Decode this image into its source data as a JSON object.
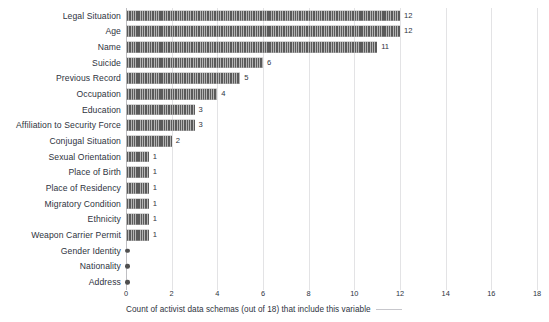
{
  "chart_data": {
    "type": "bar",
    "orientation": "horizontal",
    "title": "",
    "subtitle": "",
    "xlabel": "Count of activist data schemas (out of 18) that include this variable",
    "ylabel": "",
    "xlim": [
      0,
      18
    ],
    "xticks": [
      "0",
      "2",
      "4",
      "6",
      "8",
      "10",
      "12",
      "14",
      "16",
      "18"
    ],
    "xtick_values": [
      0,
      2,
      4,
      6,
      8,
      10,
      12,
      14,
      16,
      18
    ],
    "grid": "vertical",
    "legend": "none",
    "categories": [
      "Legal Situation",
      "Age",
      "Name",
      "Suicide",
      "Previous Record",
      "Occupation",
      "Education",
      "Affiliation to Security Force",
      "Conjugal Situation",
      "Sexual Orientation",
      "Place of Birth",
      "Place of Residency",
      "Migratory Condition",
      "Ethnicity",
      "Weapon Carrier Permit",
      "Gender Identity",
      "Nationality",
      "Address"
    ],
    "values": [
      12,
      12,
      11,
      6,
      5,
      4,
      3,
      3,
      2,
      1,
      1,
      1,
      1,
      1,
      1,
      0,
      0,
      0
    ],
    "value_labels": [
      "12",
      "12",
      "11",
      "6",
      "5",
      "4",
      "3",
      "3",
      "2",
      "1",
      "1",
      "1",
      "1",
      "1",
      "1",
      "",
      "",
      ""
    ],
    "bar_color": "#5a5a5a",
    "gridline_color": "#e3e3e5",
    "axis_color": "#bfbfc3",
    "text_color": "#2e3340",
    "background": "#ffffff"
  }
}
